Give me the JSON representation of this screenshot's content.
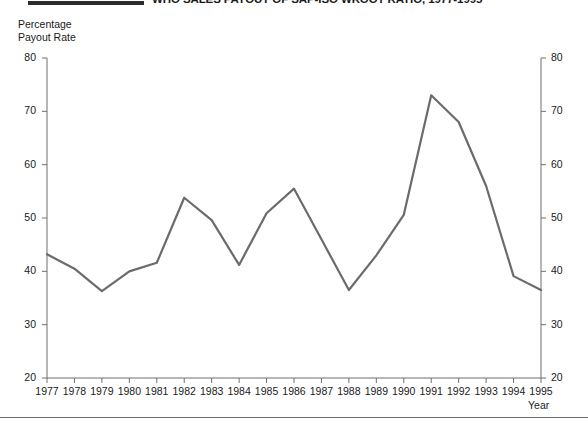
{
  "title": "WHO SALES PAYOUT OF SAP-ISO WROOT RATIO, 1977-1995",
  "title_rule": "",
  "y_axis_title": "Percentage\nPayout Rate",
  "x_axis_title": "Year",
  "chart_data": {
    "type": "line",
    "title": "WHO SALES PAYOUT OF SAP-ISO WROOT RATIO, 1977-1995",
    "xlabel": "Year",
    "ylabel": "Percentage Payout Rate",
    "xlim": [
      1977,
      1995
    ],
    "ylim": [
      20,
      80
    ],
    "grid": false,
    "legend": "none",
    "y_ticks": [
      20,
      30,
      40,
      50,
      60,
      70,
      80
    ],
    "y_ticks_right": [
      20,
      30,
      40,
      50,
      60,
      70,
      80
    ],
    "x_ticks": [
      1977,
      1978,
      1979,
      1980,
      1981,
      1982,
      1983,
      1984,
      1985,
      1986,
      1987,
      1988,
      1989,
      1990,
      1991,
      1992,
      1993,
      1994,
      1995
    ],
    "categories": [
      "1977",
      "1978",
      "1979",
      "1980",
      "1981",
      "1982",
      "1983",
      "1984",
      "1985",
      "1986",
      "1987",
      "1988",
      "1989",
      "1990",
      "1991",
      "1992",
      "1993",
      "1994",
      "1995"
    ],
    "values": [
      43.2,
      40.5,
      36.3,
      40.0,
      41.6,
      53.8,
      49.6,
      41.2,
      50.9,
      55.5,
      46.0,
      36.5,
      43.0,
      50.6,
      73.0,
      68.0,
      56.0,
      39.1,
      36.5
    ],
    "series": [
      {
        "name": "Percentage Payout Rate",
        "color": "#6b6b6b",
        "values": [
          43.2,
          40.5,
          36.3,
          40.0,
          41.6,
          53.8,
          49.6,
          41.2,
          50.9,
          55.5,
          46.0,
          36.5,
          43.0,
          50.6,
          73.0,
          68.0,
          56.0,
          39.1,
          36.5
        ]
      }
    ]
  },
  "colors": {
    "line": "#6b6b6b",
    "axis": "#6f6f6f",
    "text": "#1a1a1a"
  }
}
